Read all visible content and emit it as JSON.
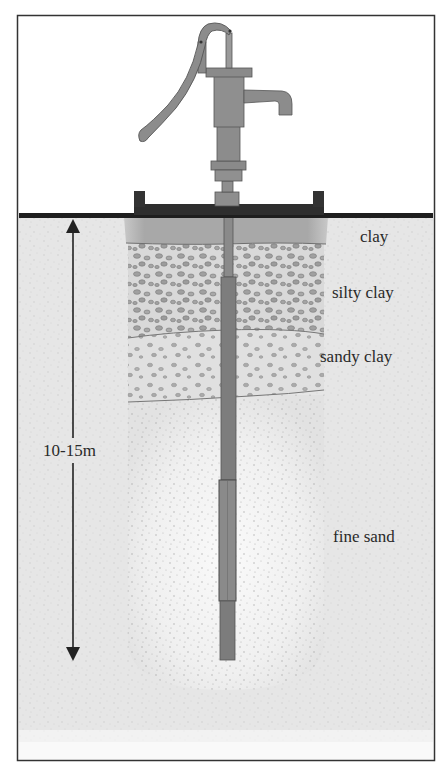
{
  "diagram": {
    "layers": [
      {
        "label": "clay"
      },
      {
        "label": "silty clay"
      },
      {
        "label": "sandy clay"
      },
      {
        "label": "fine sand"
      }
    ],
    "depth_label": "10-15m",
    "colors": {
      "frame": "#333333",
      "ground_line": "#1e1e1e",
      "soil_background": "#e6e6e6",
      "clay": "#a9a9a9",
      "gravel_layer": "#d8d8d8",
      "gravel_stone": "#8a8a8a",
      "fine_sand": "#f2f2f2",
      "pump_body": "#8c8c8c",
      "pipe": "#7a7a7a",
      "text": "#2a2a2a"
    }
  }
}
